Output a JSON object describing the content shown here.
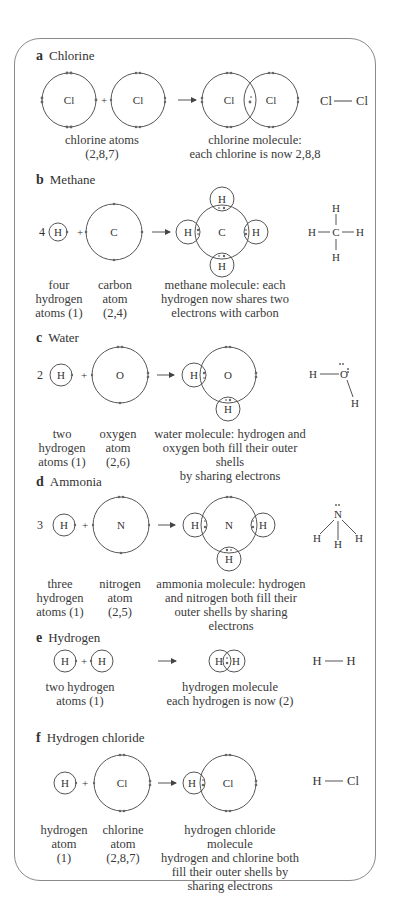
{
  "sections": [
    {
      "letter": "a",
      "name": "Chlorine",
      "captions": [
        "chlorine atoms\n(2,8,7)",
        "chlorine molecule:\neach chlorine is now 2,8,8"
      ],
      "structural": "Cl — Cl"
    },
    {
      "letter": "b",
      "name": "Methane",
      "coefficient": "4",
      "captions": [
        "four\nhydrogen\natoms (1)",
        "carbon\natom\n(2,4)",
        "methane molecule: each\nhydrogen now shares two\nelectrons with carbon"
      ],
      "structural": "CH4 displayed formula"
    },
    {
      "letter": "c",
      "name": "Water",
      "coefficient": "2",
      "captions": [
        "two\nhydrogen\natoms (1)",
        "oxygen\natom\n(2,6)",
        "water molecule: hydrogen and\noxygen both fill their outer shells\nby sharing electrons"
      ],
      "structural": "H2O displayed formula"
    },
    {
      "letter": "d",
      "name": "Ammonia",
      "coefficient": "3",
      "captions": [
        "three\nhydrogen\natoms (1)",
        "nitrogen\natom\n(2,5)",
        "ammonia molecule: hydrogen\nand nitrogen both fill their\nouter shells by sharing electrons"
      ],
      "structural": "NH3 displayed formula"
    },
    {
      "letter": "e",
      "name": "Hydrogen",
      "captions": [
        "two hydrogen\natoms (1)",
        "hydrogen molecule\neach hydrogen is now (2)"
      ],
      "structural": "H — H"
    },
    {
      "letter": "f",
      "name": "Hydrogen chloride",
      "captions": [
        "hydrogen\natom\n(1)",
        "chlorine\natom\n(2,8,7)",
        "hydrogen chloride molecule\nhydrogen and chlorine both\nfill their outer shells by\nsharing electrons"
      ],
      "structural": "H — Cl"
    }
  ],
  "symbols": {
    "Cl": "Cl",
    "H": "H",
    "C": "C",
    "O": "O",
    "N": "N",
    "plus": "+"
  },
  "colors": {
    "line": "#555555",
    "frame": "#8a8a8a",
    "text": "#333333"
  }
}
